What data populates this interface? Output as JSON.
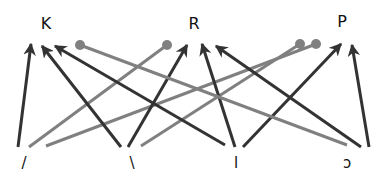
{
  "colors": {
    "dark": "#333333",
    "gray": "#808080",
    "text": "#111111"
  },
  "top_nodes": [
    {
      "id": "K",
      "label": "K",
      "x": 46,
      "y": 29
    },
    {
      "id": "R",
      "label": "R",
      "x": 194,
      "y": 29
    },
    {
      "id": "P",
      "label": "P",
      "x": 342,
      "y": 27
    }
  ],
  "bottom_nodes": [
    {
      "id": "b1",
      "label": "/",
      "x": 24,
      "y": 162
    },
    {
      "id": "b2",
      "label": "\\",
      "x": 132,
      "y": 162
    },
    {
      "id": "b3",
      "label": "l",
      "x": 236,
      "y": 162
    },
    {
      "id": "b4",
      "label": "ɔ",
      "x": 347,
      "y": 162
    }
  ],
  "edges": [
    {
      "from": "b1",
      "to": "K",
      "style": "arrow",
      "x1": 18,
      "y1": 147,
      "x2": 31,
      "y2": 44
    },
    {
      "from": "b1",
      "to": "R",
      "style": "dot",
      "x1": 29,
      "y1": 147,
      "x2": 167,
      "y2": 45
    },
    {
      "from": "b1",
      "to": "P",
      "style": "dot",
      "x1": 46,
      "y1": 146,
      "x2": 316,
      "y2": 44
    },
    {
      "from": "b2",
      "to": "K",
      "style": "arrow",
      "x1": 121,
      "y1": 147,
      "x2": 42,
      "y2": 46
    },
    {
      "from": "b2",
      "to": "R",
      "style": "arrow",
      "x1": 128,
      "y1": 147,
      "x2": 187,
      "y2": 45
    },
    {
      "from": "b2",
      "to": "P",
      "style": "dot",
      "x1": 141,
      "y1": 146,
      "x2": 300,
      "y2": 44
    },
    {
      "from": "b3",
      "to": "K",
      "style": "arrow",
      "x1": 225,
      "y1": 145,
      "x2": 55,
      "y2": 46
    },
    {
      "from": "b3",
      "to": "R",
      "style": "arrow",
      "x1": 235,
      "y1": 147,
      "x2": 202,
      "y2": 44
    },
    {
      "from": "b3",
      "to": "P",
      "style": "arrow",
      "x1": 243,
      "y1": 147,
      "x2": 341,
      "y2": 44
    },
    {
      "from": "b4",
      "to": "K",
      "style": "dot",
      "x1": 347,
      "y1": 145,
      "x2": 80,
      "y2": 45
    },
    {
      "from": "b4",
      "to": "R",
      "style": "arrow",
      "x1": 361,
      "y1": 147,
      "x2": 216,
      "y2": 46
    },
    {
      "from": "b4",
      "to": "P",
      "style": "arrow",
      "x1": 369,
      "y1": 147,
      "x2": 352,
      "y2": 45
    }
  ]
}
